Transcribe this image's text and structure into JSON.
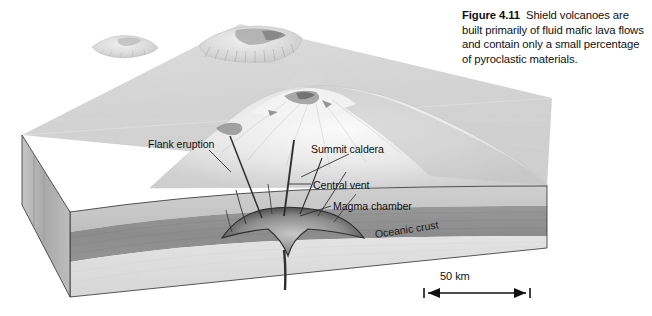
{
  "figure": {
    "number": "Figure 4.11",
    "caption_text": "Shield volcanoes are built primarily of fluid mafic lava flows and contain only a small percentage of pyroclastic materials."
  },
  "diagram": {
    "type": "3d-block-diagram",
    "labels": {
      "flank_eruption": "Flank eruption",
      "summit_caldera": "Summit caldera",
      "central_vent": "Central vent",
      "magma_chamber": "Magma chamber",
      "oceanic_crust": "Oceanic crust"
    },
    "scale_bar": {
      "label": "50 km"
    },
    "colors": {
      "top_surface": "#d4d4d4",
      "top_surface_light": "#e2e2e2",
      "volcano_highlight": "#f2f2f2",
      "front_face_upper": "#c9c9c9",
      "crust_band": "#8f8f8f",
      "lower_layer": "#dcdcdc",
      "left_face": "#b4b4b4",
      "magma": "#3a3a3a",
      "outline": "#2b2b2b",
      "label_text": "#111111"
    }
  }
}
